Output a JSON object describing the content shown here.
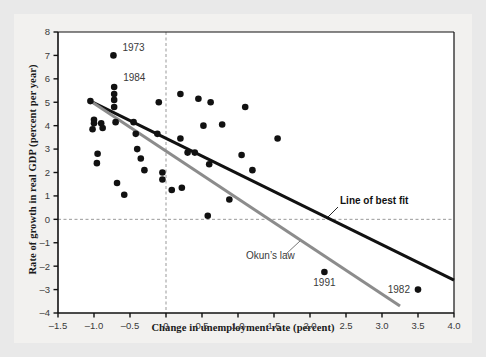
{
  "chart_data": {
    "type": "scatter",
    "title": "",
    "xlabel": "Change in unemployment rate (percent)",
    "ylabel": "Rate of growth in real GDP (percent per year)",
    "xlim": [
      -1.5,
      4.0
    ],
    "ylim": [
      -4,
      8
    ],
    "xticks": [
      -1.5,
      -1.0,
      -0.5,
      0,
      0.5,
      1.0,
      1.5,
      2.0,
      2.5,
      3.0,
      3.5,
      4.0
    ],
    "xticklabels": [
      "–1.5",
      "–1.0",
      "–0.5",
      "0",
      "0.5",
      "1.0",
      "1.5",
      "2.0",
      "2.5",
      "3.0",
      "3.5",
      "4.0"
    ],
    "yticks": [
      -4,
      -3,
      -2,
      -1,
      0,
      1,
      2,
      3,
      4,
      5,
      6,
      7,
      8
    ],
    "yticklabels": [
      "–4",
      "–3",
      "–2",
      "–1",
      "0",
      "1",
      "2",
      "3",
      "4",
      "5",
      "6",
      "7",
      "8"
    ],
    "grid": false,
    "reference_lines": [
      {
        "name": "zero-growth-horizontal",
        "orientation": "horizontal",
        "value": 0,
        "style": "dashed",
        "color": "#999999"
      },
      {
        "name": "zero-change-vertical",
        "orientation": "vertical",
        "value": 0,
        "style": "dashed",
        "color": "#999999"
      }
    ],
    "legend_position": "inline-annotations",
    "series": [
      {
        "name": "Annual observations",
        "marker": "filled-circle",
        "color": "#111111",
        "points": [
          {
            "x": -1.05,
            "y": 5.05
          },
          {
            "x": -1.0,
            "y": 4.25
          },
          {
            "x": -1.0,
            "y": 4.1
          },
          {
            "x": -1.02,
            "y": 3.85
          },
          {
            "x": -0.95,
            "y": 2.8
          },
          {
            "x": -0.96,
            "y": 2.4
          },
          {
            "x": -0.9,
            "y": 4.1
          },
          {
            "x": -0.88,
            "y": 3.9
          },
          {
            "x": -0.73,
            "y": 7.0
          },
          {
            "x": -0.72,
            "y": 5.65
          },
          {
            "x": -0.72,
            "y": 5.35
          },
          {
            "x": -0.72,
            "y": 5.1
          },
          {
            "x": -0.72,
            "y": 4.8
          },
          {
            "x": -0.7,
            "y": 4.15
          },
          {
            "x": -0.68,
            "y": 1.55
          },
          {
            "x": -0.58,
            "y": 1.05
          },
          {
            "x": -0.45,
            "y": 4.15
          },
          {
            "x": -0.42,
            "y": 3.65
          },
          {
            "x": -0.4,
            "y": 3.0
          },
          {
            "x": -0.35,
            "y": 2.6
          },
          {
            "x": -0.3,
            "y": 2.1
          },
          {
            "x": -0.12,
            "y": 3.65
          },
          {
            "x": -0.1,
            "y": 5.0
          },
          {
            "x": -0.05,
            "y": 2.0
          },
          {
            "x": -0.05,
            "y": 1.7
          },
          {
            "x": 0.08,
            "y": 1.25
          },
          {
            "x": 0.2,
            "y": 5.35
          },
          {
            "x": 0.2,
            "y": 3.45
          },
          {
            "x": 0.22,
            "y": 1.35
          },
          {
            "x": 0.3,
            "y": 2.85
          },
          {
            "x": 0.4,
            "y": 2.85
          },
          {
            "x": 0.45,
            "y": 5.15
          },
          {
            "x": 0.52,
            "y": 4.0
          },
          {
            "x": 0.58,
            "y": 0.15
          },
          {
            "x": 0.6,
            "y": 2.35
          },
          {
            "x": 0.62,
            "y": 5.0
          },
          {
            "x": 0.78,
            "y": 4.05
          },
          {
            "x": 0.88,
            "y": 0.85
          },
          {
            "x": 1.05,
            "y": 2.75
          },
          {
            "x": 1.1,
            "y": 4.8
          },
          {
            "x": 1.2,
            "y": 2.1
          },
          {
            "x": 1.55,
            "y": 3.45
          },
          {
            "x": 2.2,
            "y": -2.25
          },
          {
            "x": 3.5,
            "y": -3.0
          }
        ]
      }
    ],
    "point_labels": [
      {
        "text": "1973",
        "x": -0.73,
        "y": 7.0
      },
      {
        "text": "1984",
        "x": -0.72,
        "y": 5.65
      },
      {
        "text": "1991",
        "x": 2.2,
        "y": -2.25
      },
      {
        "text": "1982",
        "x": 3.5,
        "y": -3.0
      }
    ],
    "fit_lines": [
      {
        "name": "Line of best fit",
        "label": "Line of best fit",
        "color": "#111111",
        "width": 3,
        "x0": -1.05,
        "y0": 5.05,
        "x1": 4.0,
        "y1": -2.6
      },
      {
        "name": "Okun's law",
        "label": "Okun’s law",
        "color": "#8c8c8c",
        "width": 3,
        "x0": -1.05,
        "y0": 5.05,
        "x1": 3.25,
        "y1": -3.7
      }
    ],
    "annotations": [
      {
        "name": "best-fit-label",
        "text": "Line of best fit"
      },
      {
        "name": "okuns-law-label",
        "text": "Okun’s law"
      }
    ]
  }
}
